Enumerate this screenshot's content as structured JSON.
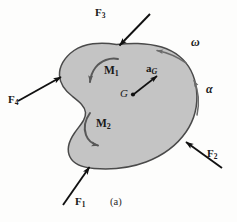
{
  "figure": {
    "caption": "(a)",
    "body_fill_color": "#c4c4c4",
    "body_stroke_color": "#4a4a4a",
    "moment_arrow_color": "#585858",
    "rotation_arrow_color": "#6b6b6b",
    "force_arrow_color": "#111111",
    "background_color": "#fdfdfc"
  },
  "forces": [
    {
      "key": "F1",
      "label": "F",
      "subscript": "1",
      "description": "external force applied at bottom edge pointing up-right"
    },
    {
      "key": "F2",
      "label": "F",
      "subscript": "2",
      "description": "external force applied at lower-right edge pointing up-left"
    },
    {
      "key": "F3",
      "label": "F",
      "subscript": "3",
      "description": "external force applied at top edge pointing down-left"
    },
    {
      "key": "F4",
      "label": "F",
      "subscript": "4",
      "description": "external force applied at left edge pointing up-right"
    }
  ],
  "moments": [
    {
      "key": "M1",
      "label": "M",
      "subscript": "1",
      "sense": "counterclockwise"
    },
    {
      "key": "M2",
      "label": "M",
      "subscript": "2",
      "sense": "clockwise"
    }
  ],
  "kinematics": {
    "mass_center": {
      "label": "G",
      "description": "mass center point"
    },
    "acceleration": {
      "label": "a",
      "subscript": "G",
      "description": "acceleration of the mass center, vector pointing up-right"
    },
    "angular_velocity": {
      "label": "ω",
      "sense": "counterclockwise",
      "description": "angular velocity"
    },
    "angular_acceleration": {
      "label": "α",
      "sense": "counterclockwise",
      "description": "angular acceleration"
    }
  }
}
